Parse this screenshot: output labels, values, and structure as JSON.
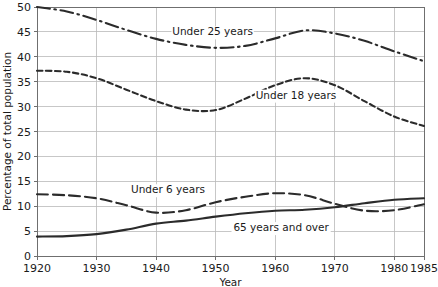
{
  "chart_data": {
    "type": "line",
    "title": "",
    "xlabel": "Year",
    "ylabel": "Percentage of total population",
    "xlim": [
      1920,
      1985
    ],
    "ylim": [
      0,
      50
    ],
    "grid": true,
    "legend_position": "inline-labels",
    "x_ticks": [
      1920,
      1930,
      1940,
      1950,
      1960,
      1970,
      1980,
      1985
    ],
    "x_tick_labels": [
      "1920",
      "1930",
      "1940",
      "1950",
      "1960",
      "1970",
      "1980",
      "1985"
    ],
    "y_ticks": [
      0,
      5,
      10,
      15,
      20,
      25,
      30,
      35,
      40,
      45,
      50
    ],
    "y_tick_labels": [
      "0",
      "5",
      "10",
      "15",
      "20",
      "25",
      "30",
      "35",
      "40",
      "45",
      "50"
    ],
    "x": [
      1920,
      1925,
      1930,
      1935,
      1940,
      1945,
      1950,
      1955,
      1960,
      1965,
      1970,
      1975,
      1980,
      1985
    ],
    "series": [
      {
        "name": "Under 25 years",
        "label": "Under 25 years",
        "style": "dash-dot",
        "color": "#2b2b2b",
        "label_x": 1949.5,
        "label_y": 44.3,
        "values": [
          50.0,
          49.1,
          47.4,
          45.4,
          43.6,
          42.4,
          41.8,
          42.2,
          43.7,
          45.3,
          44.7,
          43.2,
          41.1,
          39.1
        ]
      },
      {
        "name": "Under 18 years",
        "label": "Under 18 years",
        "style": "dashed-fine",
        "color": "#2b2b2b",
        "label_x": 1963.5,
        "label_y": 31.6,
        "values": [
          37.2,
          37.0,
          35.7,
          33.4,
          31.1,
          29.4,
          29.3,
          31.6,
          34.3,
          35.7,
          34.3,
          31.1,
          28.0,
          26.1
        ]
      },
      {
        "name": "Under 6 years",
        "label": "Under 6 years",
        "style": "dashed",
        "color": "#2b2b2b",
        "label_x": 1942.0,
        "label_y": 12.6,
        "values": [
          12.4,
          12.2,
          11.6,
          10.2,
          8.7,
          9.2,
          10.8,
          11.9,
          12.6,
          12.2,
          10.5,
          9.1,
          9.2,
          10.4
        ]
      },
      {
        "name": "65 years and over",
        "label": "65 years and over",
        "style": "solid",
        "color": "#2b2b2b",
        "label_x": 1961.0,
        "label_y": 5.0,
        "values": [
          3.9,
          4.0,
          4.4,
          5.3,
          6.5,
          7.1,
          7.9,
          8.6,
          9.1,
          9.3,
          9.8,
          10.6,
          11.3,
          11.6
        ]
      }
    ]
  },
  "plot_geometry": {
    "left": 37,
    "right": 424,
    "top": 7,
    "bottom": 256
  }
}
